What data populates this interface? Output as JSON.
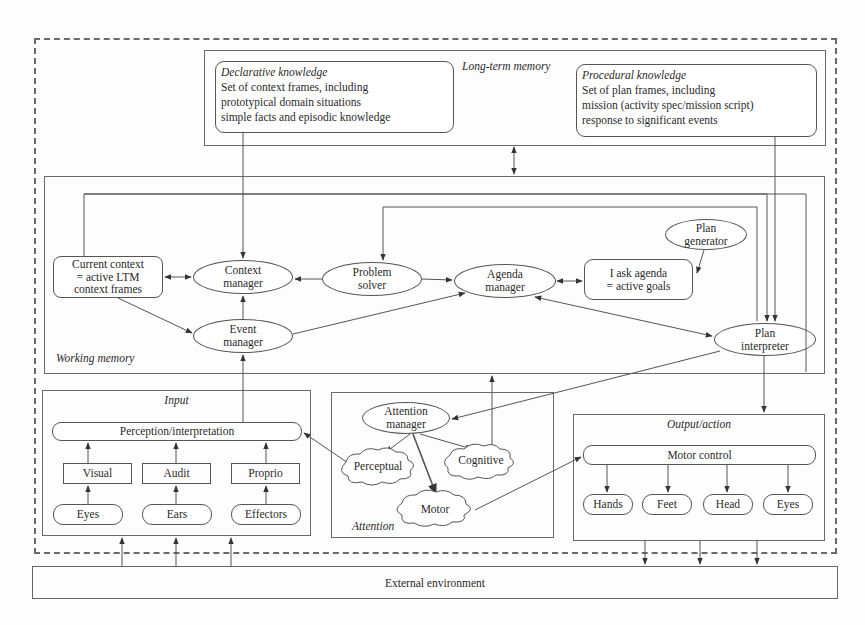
{
  "long_term_memory": {
    "label": "Long-term memory",
    "declarative": {
      "title": "Declarative knowledge",
      "lines": [
        "Set of context frames, including",
        "prototypical domain situations",
        "simple facts and episodic knowledge"
      ]
    },
    "procedural": {
      "title": "Procedural knowledge",
      "lines": [
        "Set of plan frames, including",
        "mission (activity spec/mission script)",
        "response to significant events"
      ]
    }
  },
  "working_memory": {
    "label": "Working memory",
    "current_context": [
      "Current context",
      "= active LTM",
      "context frames"
    ],
    "context_manager": [
      "Context",
      "manager"
    ],
    "event_manager": [
      "Event",
      "manager"
    ],
    "problem_solver": [
      "Problem",
      "solver"
    ],
    "agenda_manager": [
      "Agenda",
      "manager"
    ],
    "task_agenda": [
      "I ask agenda",
      "= active goals"
    ],
    "plan_generator": [
      "Plan",
      "generator"
    ],
    "plan_interpreter": [
      "Plan",
      "interpreter"
    ]
  },
  "input": {
    "label": "Input",
    "perception": "Perception/interpretation",
    "channels": [
      "Visual",
      "Audit",
      "Proprio"
    ],
    "sensors": [
      "Eyes",
      "Ears",
      "Effectors"
    ]
  },
  "attention": {
    "label": "Attention",
    "manager": [
      "Attention",
      "manager"
    ],
    "resources": [
      "Perceptual",
      "Cognitive",
      "Motor"
    ]
  },
  "output": {
    "label": "Output/action",
    "motor_control": "Motor control",
    "effectors": [
      "Hands",
      "Feet",
      "Head",
      "Eyes"
    ]
  },
  "external_environment": "External environment"
}
